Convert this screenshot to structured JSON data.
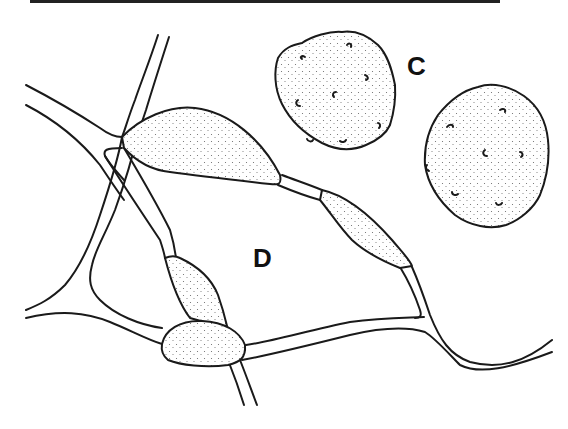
{
  "figure": {
    "type": "scientific line illustration",
    "top_rule": true,
    "labels": {
      "c": "C",
      "d": "D"
    },
    "panels": [
      {
        "id": "C",
        "description": "two round stippled spores with small hooked surface markings"
      },
      {
        "id": "D",
        "description": "branching hyphae with stippled swollen intercalary cells"
      }
    ],
    "colors": {
      "ink": "#1a1a1a",
      "background": "#ffffff"
    }
  }
}
